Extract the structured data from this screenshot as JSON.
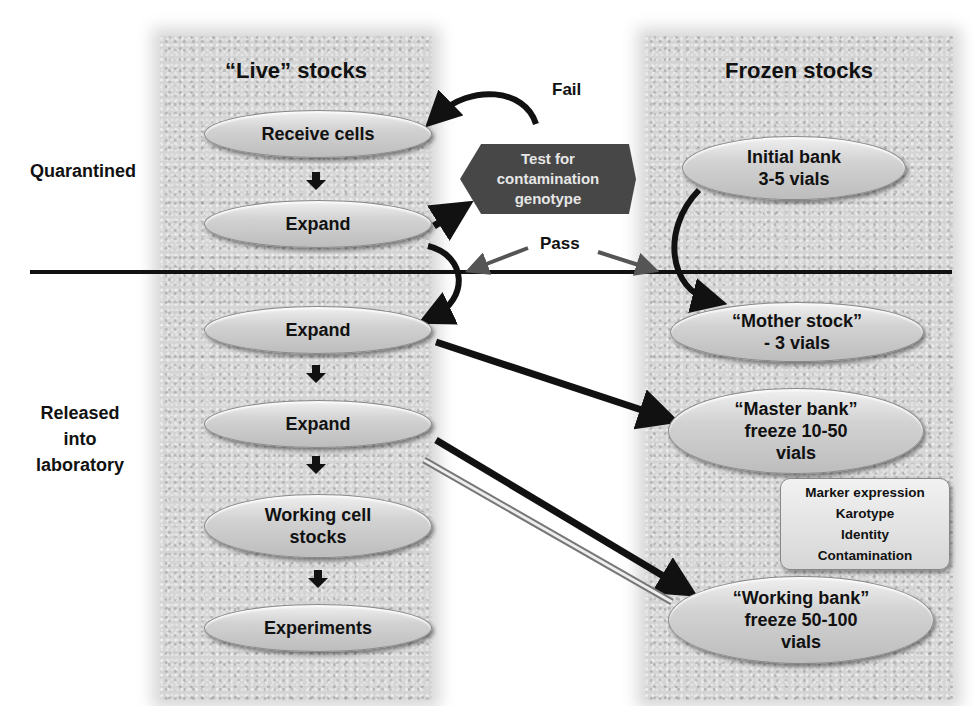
{
  "diagram": {
    "columns": {
      "live": {
        "title": "“Live” stocks"
      },
      "frozen": {
        "title": "Frozen stocks"
      }
    },
    "phases": {
      "quarantined": "Quarantined",
      "released": "Released\ninto\nlaboratory"
    },
    "live_nodes": [
      {
        "label": "Receive cells"
      },
      {
        "label": "Expand"
      },
      {
        "label": "Expand"
      },
      {
        "label": "Expand"
      },
      {
        "label": "Working cell\nstocks"
      },
      {
        "label": "Experiments"
      }
    ],
    "frozen_nodes": [
      {
        "label": "Initial bank\n3-5 vials"
      },
      {
        "label": "“Mother stock”\n-  3 vials"
      },
      {
        "label": "“Master bank”\nfreeze 10-50\nvials"
      },
      {
        "label": "“Working bank”\nfreeze 50-100\nvials"
      }
    ],
    "test_box": {
      "label": "Test for\ncontamination\ngenotype"
    },
    "edge_labels": {
      "fail": "Fail",
      "pass": "Pass"
    },
    "qc_box": {
      "items": [
        "Marker expression",
        "Karotype",
        "Identity",
        "Contamination"
      ]
    },
    "colors": {
      "panel": "#d4d4d4",
      "oval": "#cfcfcf",
      "test_box": "#474747",
      "divider": "#111111",
      "pass_arrow": "#555555"
    }
  }
}
